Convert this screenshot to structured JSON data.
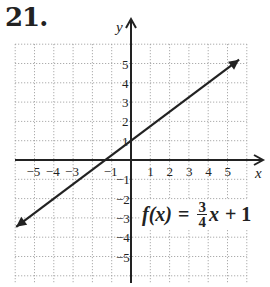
{
  "problem": {
    "number": "21."
  },
  "axes": {
    "x_label": "x",
    "y_label": "y"
  },
  "formula": {
    "lhs": "f(x)",
    "eq": "=",
    "num": "3",
    "den": "4",
    "var": "x",
    "rest": "+ 1"
  },
  "chart_data": {
    "type": "line",
    "title": "21.",
    "function": "f(x) = 3/4 x + 1",
    "slope": 0.75,
    "intercept": 1,
    "xlabel": "x",
    "ylabel": "y",
    "xlim": [
      -6,
      6
    ],
    "ylim": [
      -6,
      5.5
    ],
    "x_ticks": [
      -5,
      -4,
      -3,
      -1,
      1,
      2,
      3,
      4,
      5
    ],
    "y_ticks": [
      -5,
      -4,
      -3,
      -2,
      -1,
      1,
      2,
      3,
      4,
      5
    ],
    "grid": true,
    "x": [
      -6,
      -4,
      0,
      6
    ],
    "y": [
      -3.5,
      -2,
      1,
      5.5
    ],
    "annotations": [
      "f(x) = 3/4x + 1"
    ]
  }
}
